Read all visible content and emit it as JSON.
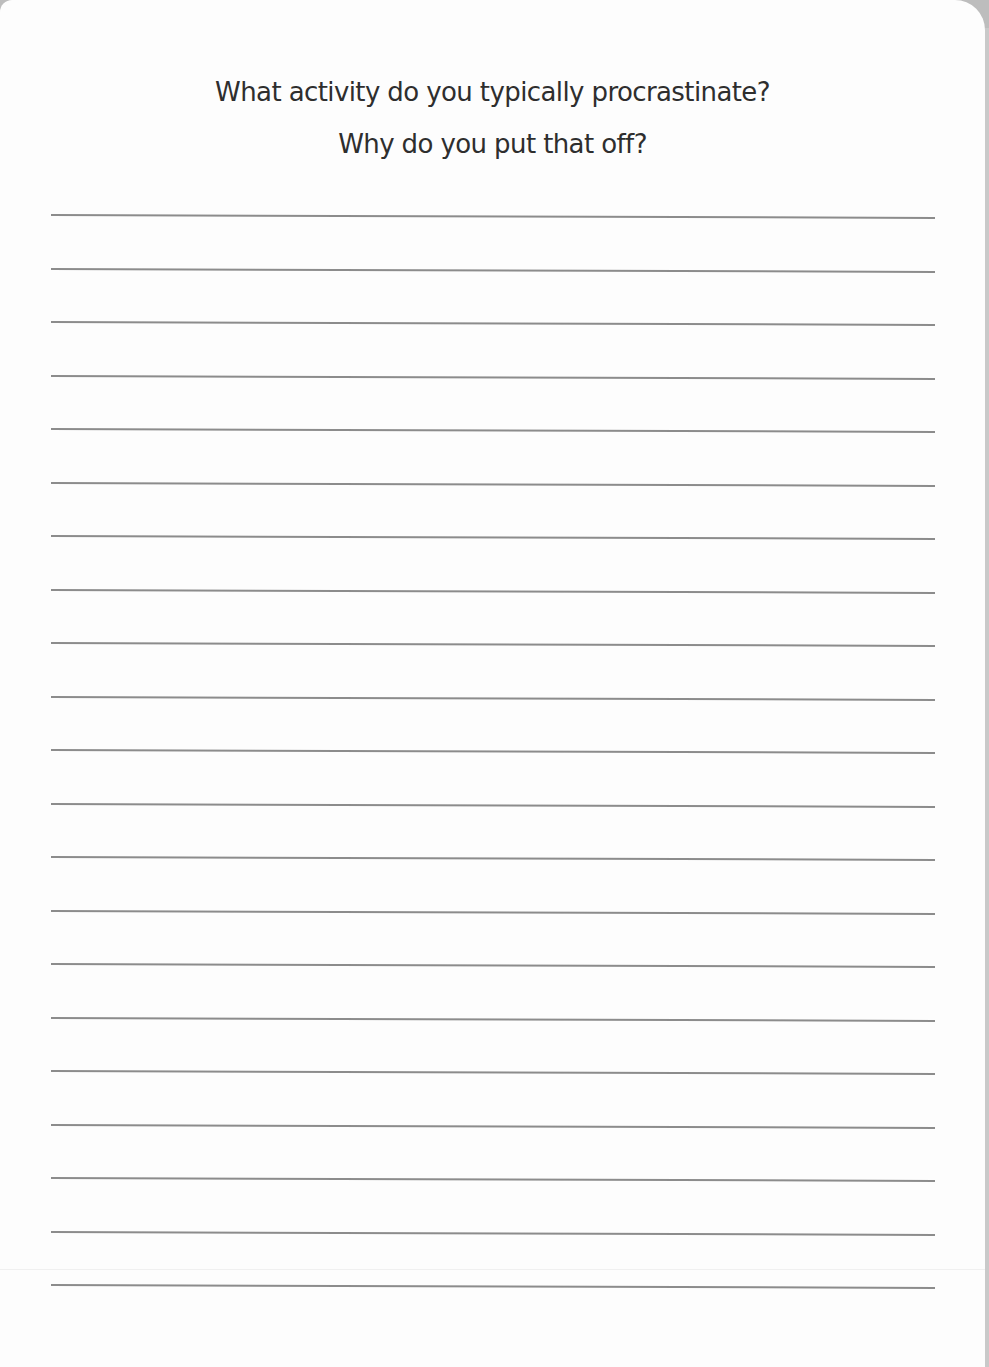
{
  "prompt": {
    "line1": "What activity do you typically procrastinate?",
    "line2": "Why do you put that off?"
  },
  "writing_area": {
    "line_count": 21,
    "line_color": "#8c8c8c",
    "first_line_y": 214,
    "line_spacing": 53.5
  },
  "colors": {
    "page": "#fdfdfd",
    "text": "#2e2e2e",
    "edge": "#c9c9c9"
  }
}
